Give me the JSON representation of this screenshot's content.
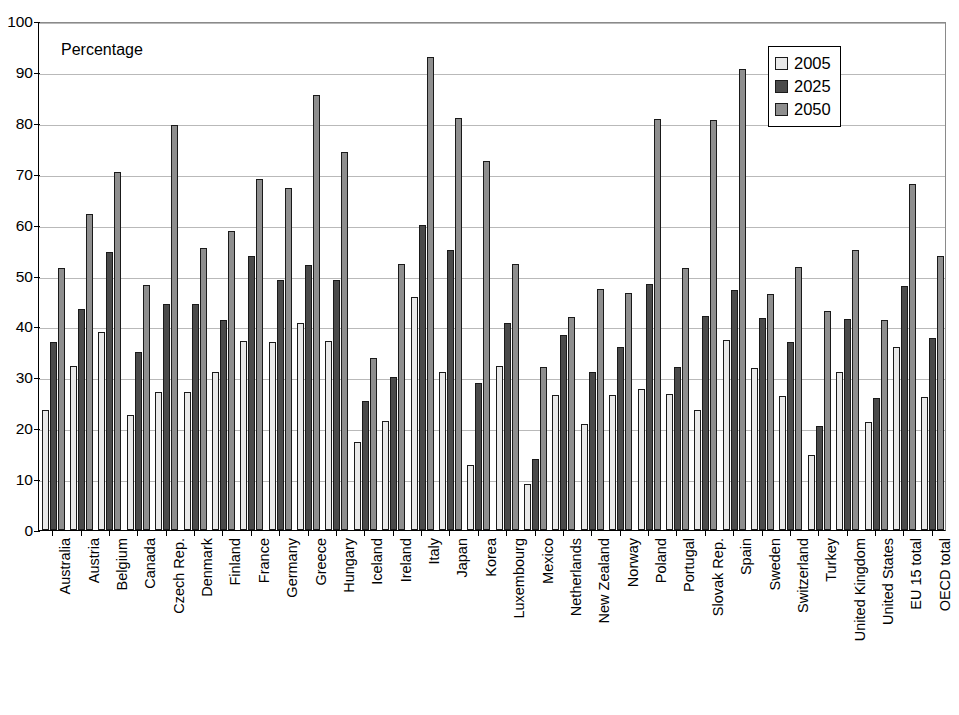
{
  "chart_data": {
    "type": "bar",
    "title": "",
    "annotation": "Percentage",
    "xlabel": "",
    "ylabel": "",
    "ylim": [
      0,
      100
    ],
    "yticks": [
      0,
      10,
      20,
      30,
      40,
      50,
      60,
      70,
      80,
      90,
      100
    ],
    "grid": true,
    "legend_position": "top-right",
    "categories": [
      "Australia",
      "Austria",
      "Belgium",
      "Canada",
      "Czech Rep.",
      "Denmark",
      "Finland",
      "France",
      "Germany",
      "Greece",
      "Hungary",
      "Iceland",
      "Ireland",
      "Italy",
      "Japan",
      "Korea",
      "Luxembourg",
      "Mexico",
      "Netherlands",
      "New Zealand",
      "Norway",
      "Poland",
      "Portugal",
      "Slovak Rep.",
      "Spain",
      "Sweden",
      "Switzerland",
      "Turkey",
      "United Kingdom",
      "United States",
      "EU 15 total",
      "OECD total"
    ],
    "series": [
      {
        "name": "2005",
        "color": "#e9e9e9",
        "values": [
          23.5,
          32.2,
          38.9,
          22.5,
          27.1,
          27.1,
          31.1,
          37.1,
          37.0,
          40.6,
          37.1,
          17.2,
          21.5,
          45.7,
          31.0,
          12.8,
          32.2,
          9.0,
          26.6,
          20.8,
          26.5,
          27.8,
          26.8,
          23.5,
          37.3,
          31.8,
          26.4,
          14.7,
          31.0,
          21.2,
          36.0,
          26.2
        ]
      },
      {
        "name": "2025",
        "color": "#4a4a4a",
        "values": [
          37.0,
          43.5,
          54.7,
          35.0,
          44.4,
          44.4,
          41.3,
          53.8,
          49.1,
          52.0,
          49.1,
          25.3,
          30.0,
          60.0,
          55.0,
          28.8,
          40.7,
          14.0,
          38.4,
          31.0,
          36.0,
          48.3,
          32.0,
          42.0,
          47.2,
          41.7,
          37.0,
          20.5,
          41.5,
          26.0,
          48.0,
          37.8
        ]
      },
      {
        "name": "2050",
        "color": "#8e8e8e",
        "values": [
          51.5,
          62.0,
          70.3,
          48.1,
          79.6,
          55.5,
          58.7,
          69.0,
          67.2,
          85.4,
          74.2,
          33.8,
          52.3,
          93.0,
          81.0,
          72.5,
          52.2,
          32.0,
          41.8,
          47.4,
          46.5,
          80.8,
          51.5,
          80.6,
          90.6,
          46.3,
          51.6,
          43.0,
          55.0,
          41.3,
          68.0,
          53.9
        ]
      }
    ]
  },
  "legend": {
    "items": [
      {
        "label": "2005",
        "swatch_class": "s2005"
      },
      {
        "label": "2025",
        "swatch_class": "s2025"
      },
      {
        "label": "2050",
        "swatch_class": "s2050"
      }
    ]
  },
  "colors": {
    "series_2005": "#e9e9e9",
    "series_2025": "#4a4a4a",
    "series_2050": "#8e8e8e",
    "axis": "#000000",
    "grid": "#b9b9b9",
    "background": "#ffffff"
  }
}
